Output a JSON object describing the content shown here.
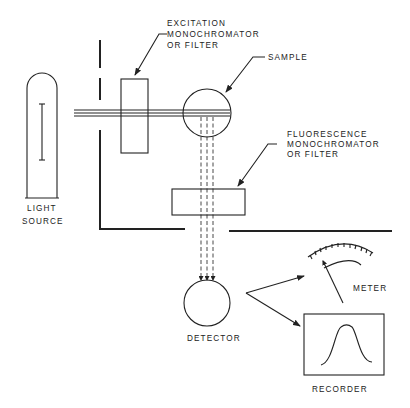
{
  "diagram": {
    "components": [
      {
        "id": "light-source",
        "label_lines": [
          "LIGHT",
          "SOURCE"
        ]
      },
      {
        "id": "excitation",
        "label_lines": [
          "EXCITATION",
          "MONOCHROMATOR",
          "OR  FILTER"
        ]
      },
      {
        "id": "sample",
        "label_lines": [
          "SAMPLE"
        ]
      },
      {
        "id": "fluorescence",
        "label_lines": [
          "FLUORESCENCE",
          "MONOCHROMATOR",
          "OR  FILTER"
        ]
      },
      {
        "id": "detector",
        "label_lines": [
          "DETECTOR"
        ]
      },
      {
        "id": "meter",
        "label_lines": [
          "METER"
        ]
      },
      {
        "id": "recorder",
        "label_lines": [
          "RECORDER"
        ]
      }
    ],
    "connections": [
      {
        "from": "light-source",
        "to": "excitation",
        "style": "solid-beam"
      },
      {
        "from": "excitation",
        "to": "sample",
        "style": "solid-beam"
      },
      {
        "from": "sample",
        "to": "fluorescence",
        "style": "dashed-beam"
      },
      {
        "from": "fluorescence",
        "to": "detector",
        "style": "dashed-beam-arrow"
      },
      {
        "from": "detector",
        "to": "meter",
        "style": "arrow"
      },
      {
        "from": "detector",
        "to": "recorder",
        "style": "arrow"
      }
    ],
    "colors": {
      "ink": "#222222",
      "background": "#ffffff"
    }
  },
  "labels": {
    "excitation": {
      "l1": "EXCITATION",
      "l2": "MONOCHROMATOR",
      "l3": "OR  FILTER"
    },
    "sample": {
      "l1": "SAMPLE"
    },
    "fluorescence": {
      "l1": "FLUORESCENCE",
      "l2": "MONOCHROMATOR",
      "l3": "OR  FILTER"
    },
    "light_source": {
      "l1": "LIGHT",
      "l2": "SOURCE"
    },
    "detector": {
      "l1": "DETECTOR"
    },
    "meter": {
      "l1": "METER"
    },
    "recorder": {
      "l1": "RECORDER"
    }
  }
}
